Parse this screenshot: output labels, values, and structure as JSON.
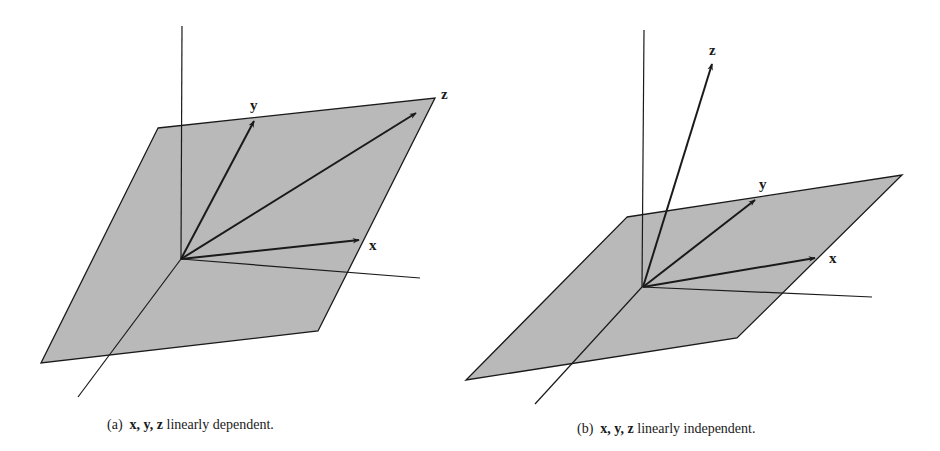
{
  "figures": [
    {
      "id": "a",
      "caption_prefix": "(a)",
      "caption_vars": "x, y, z",
      "caption_text": "linearly dependent.",
      "vectors": [
        {
          "name": "x",
          "label": "x"
        },
        {
          "name": "y",
          "label": "y"
        },
        {
          "name": "z",
          "label": "z"
        }
      ],
      "description": "All three vectors lie in the shaded plane."
    },
    {
      "id": "b",
      "caption_prefix": "(b)",
      "caption_vars": "x, y, z",
      "caption_text": "linearly independent.",
      "vectors": [
        {
          "name": "x",
          "label": "x"
        },
        {
          "name": "y",
          "label": "y"
        },
        {
          "name": "z",
          "label": "z"
        }
      ],
      "description": "x and y lie in the shaded plane; z points out of it."
    }
  ],
  "colors": {
    "plane_fill": "#b9b9b9",
    "line": "#1a1a1a",
    "background": "#ffffff"
  }
}
